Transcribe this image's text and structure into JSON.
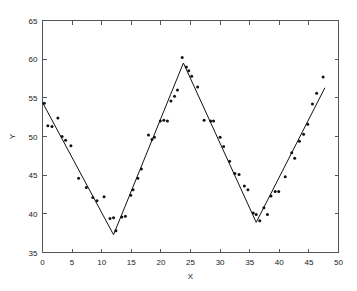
{
  "chart_data": {
    "type": "scatter",
    "title": "",
    "xlabel": "X",
    "ylabel": "Y",
    "xlim": [
      0,
      50
    ],
    "ylim": [
      35,
      65
    ],
    "xticks": [
      0,
      5,
      10,
      15,
      20,
      25,
      30,
      35,
      40,
      45,
      50
    ],
    "yticks": [
      35,
      40,
      45,
      50,
      55,
      60,
      65
    ],
    "grid": false,
    "legend": null,
    "marker": "dot",
    "marker_color": "#111111",
    "line_color": "#111111",
    "background_color": "#ffffff",
    "frame_color": "#555555",
    "series": [
      {
        "name": "observations",
        "type": "scatter",
        "points": [
          [
            0.3,
            54.3
          ],
          [
            0.9,
            51.4
          ],
          [
            1.6,
            51.3
          ],
          [
            2.6,
            52.4
          ],
          [
            3.3,
            50.0
          ],
          [
            3.9,
            49.5
          ],
          [
            4.8,
            48.8
          ],
          [
            6.1,
            44.6
          ],
          [
            7.4,
            43.4
          ],
          [
            8.5,
            42.1
          ],
          [
            9.2,
            41.7
          ],
          [
            10.4,
            42.2
          ],
          [
            11.4,
            39.4
          ],
          [
            12.0,
            39.5
          ],
          [
            12.4,
            37.8
          ],
          [
            13.4,
            39.6
          ],
          [
            14.0,
            39.7
          ],
          [
            14.9,
            42.4
          ],
          [
            15.3,
            43.1
          ],
          [
            16.1,
            44.6
          ],
          [
            16.7,
            45.8
          ],
          [
            17.9,
            50.2
          ],
          [
            18.5,
            49.6
          ],
          [
            18.9,
            49.9
          ],
          [
            19.9,
            52.0
          ],
          [
            20.5,
            52.1
          ],
          [
            21.1,
            52.0
          ],
          [
            21.7,
            54.6
          ],
          [
            22.3,
            55.2
          ],
          [
            22.8,
            56.0
          ],
          [
            23.6,
            60.2
          ],
          [
            24.3,
            59.0
          ],
          [
            24.7,
            58.5
          ],
          [
            25.2,
            57.8
          ],
          [
            26.2,
            56.4
          ],
          [
            27.3,
            52.1
          ],
          [
            28.4,
            52.0
          ],
          [
            28.9,
            52.0
          ],
          [
            30.0,
            49.9
          ],
          [
            30.6,
            48.7
          ],
          [
            31.6,
            46.8
          ],
          [
            32.5,
            45.2
          ],
          [
            33.2,
            45.1
          ],
          [
            34.1,
            43.6
          ],
          [
            34.7,
            43.1
          ],
          [
            35.6,
            40.1
          ],
          [
            36.1,
            39.9
          ],
          [
            36.7,
            39.1
          ],
          [
            37.4,
            40.8
          ],
          [
            38.0,
            39.9
          ],
          [
            38.6,
            42.3
          ],
          [
            39.3,
            42.9
          ],
          [
            39.9,
            42.9
          ],
          [
            41.0,
            44.8
          ],
          [
            42.1,
            47.9
          ],
          [
            42.6,
            47.2
          ],
          [
            43.4,
            49.4
          ],
          [
            44.1,
            50.3
          ],
          [
            44.8,
            51.6
          ],
          [
            45.6,
            54.2
          ],
          [
            46.3,
            55.6
          ],
          [
            47.4,
            57.7
          ]
        ]
      },
      {
        "name": "triangular-fit",
        "type": "line",
        "vertices": [
          [
            0.0,
            54.4
          ],
          [
            12.0,
            37.3
          ],
          [
            23.8,
            59.5
          ],
          [
            36.1,
            38.9
          ],
          [
            47.7,
            56.3
          ]
        ]
      }
    ]
  }
}
